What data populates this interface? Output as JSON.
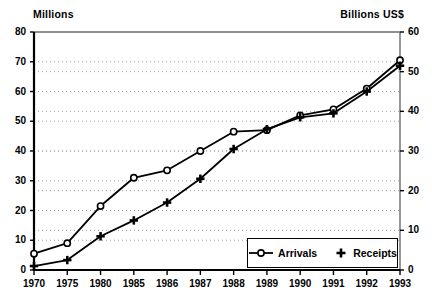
{
  "chart_data": {
    "type": "line",
    "title": "",
    "subtitle": "",
    "xlabel": "",
    "categories": [
      "1970",
      "1975",
      "1980",
      "1985",
      "1986",
      "1987",
      "1988",
      "1989",
      "1990",
      "1991",
      "1992",
      "1993"
    ],
    "axes": {
      "left": {
        "label": "Millions",
        "ticks": [
          "0",
          "10",
          "20",
          "30",
          "40",
          "50",
          "60",
          "70",
          "80"
        ],
        "tick_values": [
          0,
          10,
          20,
          30,
          40,
          50,
          60,
          70,
          80
        ],
        "ylim": [
          0,
          80
        ]
      },
      "right": {
        "label": "Billions US$",
        "ticks": [
          "0",
          "10",
          "20",
          "30",
          "40",
          "50",
          "60"
        ],
        "tick_values": [
          0,
          10,
          20,
          30,
          40,
          50,
          60
        ],
        "ylim": [
          0,
          60
        ]
      }
    },
    "grid": "horizontal-dotted",
    "legend_position": "bottom-right",
    "series": [
      {
        "name": "Arrivals",
        "axis": "left",
        "marker": "open-circle",
        "values": [
          5.5,
          9.0,
          21.5,
          31.0,
          33.5,
          40.0,
          46.5,
          47.0,
          52.0,
          54.0,
          61.0,
          70.5
        ]
      },
      {
        "name": "Receipts",
        "axis": "right",
        "marker": "plus",
        "values": [
          1.0,
          2.5,
          8.5,
          12.5,
          17.0,
          23.0,
          30.5,
          35.5,
          38.5,
          39.5,
          45.0,
          51.5
        ]
      }
    ],
    "colors": {
      "line": "#000000",
      "marker_fill": "#ffffff",
      "grid": "#999999",
      "axis": "#000000",
      "background": "#ffffff"
    }
  },
  "legend": {
    "items": [
      {
        "label": "Arrivals",
        "marker": "open-circle"
      },
      {
        "label": "Receipts",
        "marker": "plus"
      }
    ]
  }
}
